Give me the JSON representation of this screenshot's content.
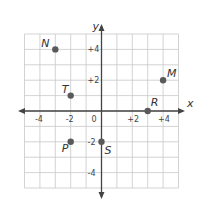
{
  "chart_data": {
    "type": "scatter",
    "title": "",
    "xlabel": "x",
    "ylabel": "y",
    "xlim": [
      -5,
      5
    ],
    "ylim": [
      -5,
      5
    ],
    "grid": true,
    "x_ticks": [
      "-4",
      "-2",
      "0",
      "+2",
      "+4"
    ],
    "y_ticks": [
      "+4",
      "+2",
      "-2",
      "-4"
    ],
    "points": [
      {
        "label": "N",
        "x": -3,
        "y": 4
      },
      {
        "label": "T",
        "x": -2,
        "y": 1
      },
      {
        "label": "P",
        "x": -2,
        "y": -2
      },
      {
        "label": "S",
        "x": 0,
        "y": -2
      },
      {
        "label": "R",
        "x": 3,
        "y": 0
      },
      {
        "label": "M",
        "x": 4,
        "y": 2
      }
    ],
    "colors": {
      "grid": "#c8c8c8",
      "axis": "#444444",
      "point": "#5a5a5a"
    }
  }
}
